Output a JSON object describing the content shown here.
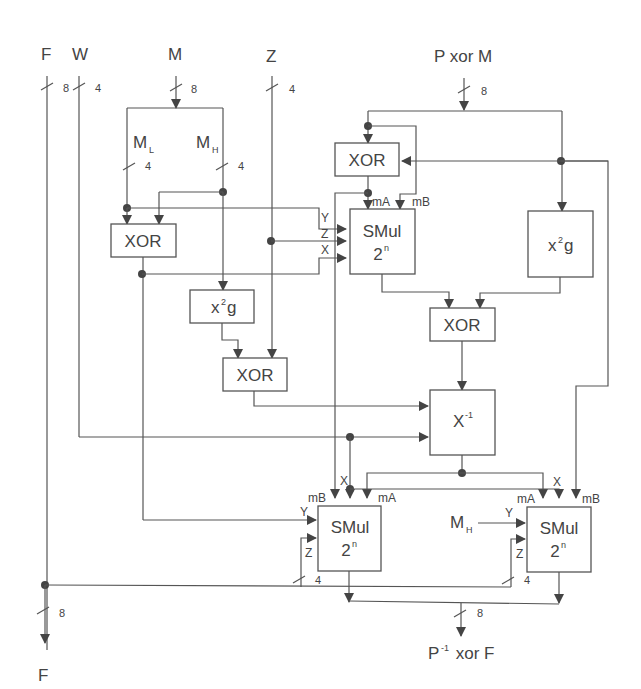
{
  "diagram": {
    "type": "circuit-block-diagram",
    "inputs": {
      "F": "F",
      "W": "W",
      "M": "M",
      "Z": "Z",
      "PxorM": "P xor M"
    },
    "outputs": {
      "F": "F",
      "result": "P",
      "result_sup": "-1",
      "result_tail": " xor F"
    },
    "bus_widths": {
      "F": "8",
      "W": "4",
      "M": "8",
      "Z": "4",
      "PxorM": "8",
      "ML": "4",
      "MH": "4",
      "z_left": "4",
      "z_right": "4",
      "F_out": "8",
      "out": "8"
    },
    "split_labels": {
      "ML": "M",
      "ML_sub": "L",
      "MH": "M",
      "MH_sub": "H",
      "MH2": "M",
      "MH2_sub": "H"
    },
    "blocks": {
      "xor_top": "XOR",
      "xor_left": "XOR",
      "xor_mid": "XOR",
      "xor_center": "XOR",
      "smul_top_l1": "SMul",
      "smul_top_l2": "2",
      "smul_top_sup": "n",
      "x2g_right": "x",
      "x2g_right_sup": "2",
      "x2g_right_tail": "g",
      "x2g_left": "x",
      "x2g_left_sup": "2",
      "x2g_left_tail": "g",
      "inv": "X",
      "inv_sup": "-1",
      "smul_bl_l1": "SMul",
      "smul_bl_l2": "2",
      "smul_bl_sup": "n",
      "smul_br_l1": "SMul",
      "smul_br_l2": "2",
      "smul_br_sup": "n"
    },
    "port_labels": {
      "mA": "mA",
      "mB": "mB",
      "X": "X",
      "Y": "Y",
      "Z": "Z"
    }
  }
}
